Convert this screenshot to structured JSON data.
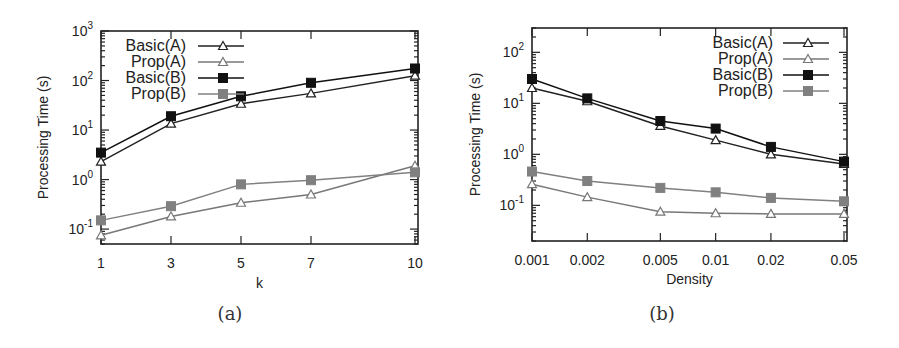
{
  "chart_data": [
    {
      "type": "line",
      "panel": "(a)",
      "caption": "(a)",
      "xlabel": "k",
      "ylabel": "Processing Time (s)",
      "yscale": "log",
      "x": [
        1,
        3,
        5,
        7,
        10
      ],
      "x_tick_labels": [
        "1",
        "3",
        "5",
        "7",
        "10"
      ],
      "y_ticks": [
        "10^-1",
        "10^0",
        "10^1",
        "10^2",
        "10^3"
      ],
      "ylim": [
        0.05,
        1000
      ],
      "grid": false,
      "legend_position": "upper-left inside",
      "series": [
        {
          "name": "Basic(A)",
          "marker": "open-triangle",
          "color": "#222222",
          "values": [
            2.3,
            13.5,
            34,
            55,
            125
          ]
        },
        {
          "name": "Prop(A)",
          "marker": "open-triangle",
          "color": "#777777",
          "values": [
            0.075,
            0.18,
            0.34,
            0.5,
            1.9
          ]
        },
        {
          "name": "Basic(B)",
          "marker": "filled-square",
          "color": "#111111",
          "values": [
            3.5,
            19,
            48,
            90,
            175
          ]
        },
        {
          "name": "Prop(B)",
          "marker": "filled-square",
          "color": "#808080",
          "values": [
            0.15,
            0.29,
            0.8,
            0.97,
            1.4
          ]
        }
      ]
    },
    {
      "type": "line",
      "panel": "(b)",
      "caption": "(b)",
      "xlabel": "Density",
      "ylabel": "Processing Time (s)",
      "yscale": "log",
      "xscale": "log",
      "x": [
        0.001,
        0.002,
        0.005,
        0.01,
        0.02,
        0.05
      ],
      "x_tick_labels": [
        "0.001",
        "0.002",
        "0.005",
        "0.01",
        "0.02",
        "0.05"
      ],
      "y_ticks": [
        "10^-1",
        "10^0",
        "10^1",
        "10^2"
      ],
      "ylim": [
        0.02,
        300
      ],
      "grid": false,
      "legend_position": "upper-right inside",
      "series": [
        {
          "name": "Basic(A)",
          "marker": "open-triangle",
          "color": "#222222",
          "values": [
            20,
            11,
            3.6,
            1.9,
            1.0,
            0.65
          ]
        },
        {
          "name": "Prop(A)",
          "marker": "open-triangle",
          "color": "#777777",
          "values": [
            0.26,
            0.145,
            0.075,
            0.07,
            0.068,
            0.068
          ]
        },
        {
          "name": "Basic(B)",
          "marker": "filled-square",
          "color": "#111111",
          "values": [
            30,
            12.5,
            4.5,
            3.2,
            1.4,
            0.72
          ]
        },
        {
          "name": "Prop(B)",
          "marker": "filled-square",
          "color": "#808080",
          "values": [
            0.46,
            0.3,
            0.22,
            0.18,
            0.14,
            0.12
          ]
        }
      ]
    }
  ]
}
